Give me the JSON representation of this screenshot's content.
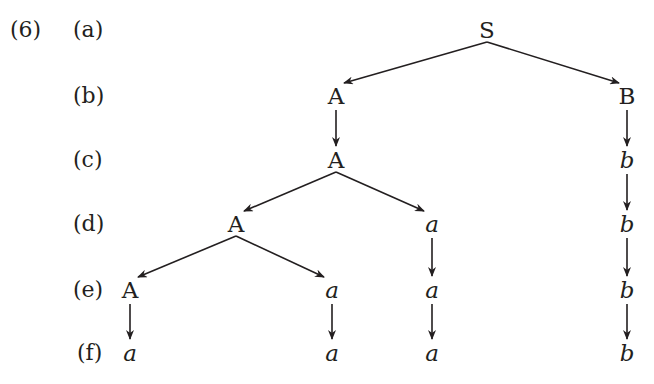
{
  "example_number": "(6)",
  "row_labels": [
    "(a)",
    "(b)",
    "(c)",
    "(d)",
    "(e)",
    "(f)"
  ],
  "nodes": [
    {
      "id": "S",
      "text": "S",
      "italic": false,
      "x": 487,
      "y": 30
    },
    {
      "id": "A1",
      "text": "A",
      "italic": false,
      "x": 336,
      "y": 96
    },
    {
      "id": "B",
      "text": "B",
      "italic": false,
      "x": 627,
      "y": 96
    },
    {
      "id": "A2",
      "text": "A",
      "italic": false,
      "x": 336,
      "y": 160
    },
    {
      "id": "b1",
      "text": "b",
      "italic": true,
      "x": 627,
      "y": 160
    },
    {
      "id": "A3",
      "text": "A",
      "italic": false,
      "x": 236,
      "y": 224
    },
    {
      "id": "a1",
      "text": "a",
      "italic": true,
      "x": 432,
      "y": 224
    },
    {
      "id": "b2",
      "text": "b",
      "italic": true,
      "x": 627,
      "y": 224
    },
    {
      "id": "A4",
      "text": "A",
      "italic": false,
      "x": 130,
      "y": 290
    },
    {
      "id": "a2",
      "text": "a",
      "italic": true,
      "x": 332,
      "y": 290
    },
    {
      "id": "a3",
      "text": "a",
      "italic": true,
      "x": 432,
      "y": 290
    },
    {
      "id": "b3",
      "text": "b",
      "italic": true,
      "x": 627,
      "y": 290
    },
    {
      "id": "a4",
      "text": "a",
      "italic": true,
      "x": 130,
      "y": 353
    },
    {
      "id": "a5",
      "text": "a",
      "italic": true,
      "x": 332,
      "y": 353
    },
    {
      "id": "a6",
      "text": "a",
      "italic": true,
      "x": 432,
      "y": 353
    },
    {
      "id": "b4",
      "text": "b",
      "italic": true,
      "x": 627,
      "y": 353
    }
  ],
  "edges": [
    [
      "S",
      "A1"
    ],
    [
      "S",
      "B"
    ],
    [
      "A1",
      "A2"
    ],
    [
      "B",
      "b1"
    ],
    [
      "A2",
      "A3"
    ],
    [
      "A2",
      "a1"
    ],
    [
      "b1",
      "b2"
    ],
    [
      "A3",
      "A4"
    ],
    [
      "A3",
      "a2"
    ],
    [
      "a1",
      "a3"
    ],
    [
      "b2",
      "b3"
    ],
    [
      "A4",
      "a4"
    ],
    [
      "a2",
      "a5"
    ],
    [
      "a3",
      "a6"
    ],
    [
      "b3",
      "b4"
    ]
  ],
  "colors": {
    "ink": "#231f20"
  }
}
